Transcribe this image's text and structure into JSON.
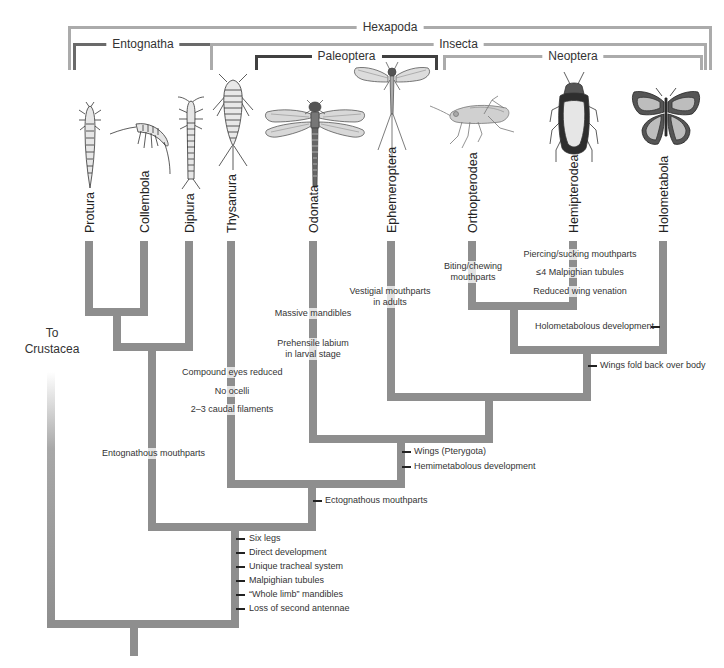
{
  "clades": {
    "hexapoda": "Hexapoda",
    "entognatha": "Entognatha",
    "insecta": "Insecta",
    "paleoptera": "Paleoptera",
    "neoptera": "Neoptera"
  },
  "taxa": [
    {
      "name": "Protura",
      "icon": "proturan-icon"
    },
    {
      "name": "Collembola",
      "icon": "springtail-icon"
    },
    {
      "name": "Diplura",
      "icon": "dipluran-icon"
    },
    {
      "name": "Thysanura",
      "icon": "silverfish-icon"
    },
    {
      "name": "Odonata",
      "icon": "dragonfly-icon"
    },
    {
      "name": "Ephemeroptera",
      "icon": "mayfly-icon"
    },
    {
      "name": "Orthopterodea",
      "icon": "grasshopper-icon"
    },
    {
      "name": "Hemipterodea",
      "icon": "true-bug-icon"
    },
    {
      "name": "Holometabola",
      "icon": "butterfly-icon"
    }
  ],
  "outgroup": {
    "line1": "To",
    "line2": "Crustacea"
  },
  "traits": {
    "hexapoda": [
      "Six legs",
      "Direct development",
      "Unique tracheal system",
      "Malpighian tubules",
      "“Whole limb” mandibles",
      "Loss of second antennae"
    ],
    "entognatha": "Entognathous mouthparts",
    "insecta": "Ectognathous mouthparts",
    "thysanura": [
      "Compound eyes reduced",
      "No ocelli",
      "2–3 caudal filaments"
    ],
    "pterygota": [
      "Wings (Pterygota)",
      "Hemimetabolous development"
    ],
    "odonata": [
      "Massive mandibles",
      "Prehensile labium",
      "in larval stage"
    ],
    "ephemeroptera": [
      "Vestigial mouthparts",
      "in adults"
    ],
    "neoptera": "Wings fold back over body",
    "orthopterodea": [
      "Biting/chewing",
      "mouthparts"
    ],
    "hemipterodea": [
      "Piercing/sucking mouthparts",
      "≤4 Malpighian tubules",
      "Reduced wing venation"
    ],
    "holometabola": "Holometabolous development"
  },
  "colors": {
    "branch": "#8e8e8e",
    "bracket_light": "#ababab",
    "bracket_mid": "#6a6a6a",
    "bracket_dark": "#404040"
  }
}
